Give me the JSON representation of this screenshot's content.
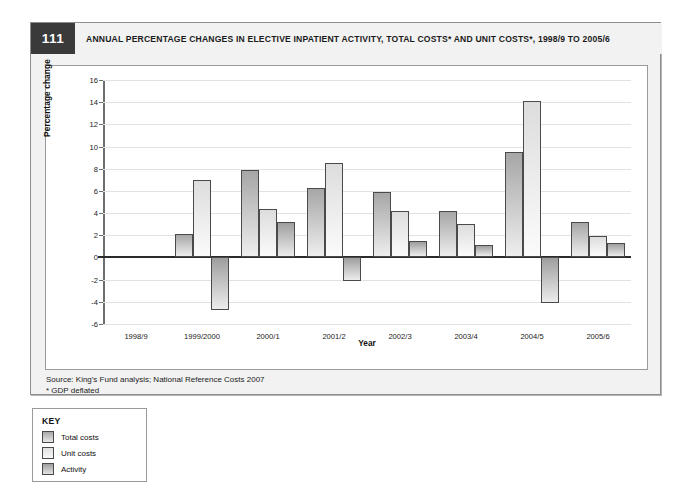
{
  "figure": {
    "number": "111",
    "title": "ANNUAL PERCENTAGE CHANGES IN ELECTIVE INPATIENT ACTIVITY, TOTAL COSTS* AND UNIT COSTS*, 1998/9 TO 2005/6",
    "source": "Source: King's Fund analysis; National Reference Costs 2007",
    "footnote": "* GDP deflated"
  },
  "key": {
    "title": "KEY",
    "items": [
      {
        "label": "Total costs",
        "swatch": "total"
      },
      {
        "label": "Unit costs",
        "swatch": "unit"
      },
      {
        "label": "Activity",
        "swatch": "activity"
      }
    ]
  },
  "chart_data": {
    "type": "bar",
    "title": "ANNUAL PERCENTAGE CHANGES IN ELECTIVE INPATIENT ACTIVITY, TOTAL COSTS* AND UNIT COSTS*, 1998/9 TO 2005/6",
    "xlabel": "Year",
    "ylabel": "Percentage change",
    "ylim": [
      -6,
      16
    ],
    "yticks": [
      16,
      14,
      12,
      10,
      8,
      6,
      4,
      2,
      0,
      -2,
      -4,
      -6
    ],
    "ytick_labels": [
      "16",
      "14",
      "12",
      "10",
      "8",
      "6",
      "4",
      "2",
      "0",
      "-2",
      "-4",
      "-6"
    ],
    "grid": true,
    "legend_position": "below-left",
    "categories": [
      "1998/9",
      "1999/2000",
      "2000/1",
      "2001/2",
      "2002/3",
      "2003/4",
      "2004/5",
      "2005/6"
    ],
    "series": [
      {
        "name": "Total costs",
        "values": [
          null,
          2.1,
          7.9,
          6.3,
          5.9,
          4.2,
          9.5,
          3.2
        ]
      },
      {
        "name": "Unit costs",
        "values": [
          null,
          7.0,
          4.4,
          8.5,
          4.2,
          3.0,
          14.1,
          1.9
        ]
      },
      {
        "name": "Activity",
        "values": [
          null,
          -4.7,
          3.2,
          -2.1,
          1.5,
          1.1,
          -4.1,
          1.3
        ]
      }
    ]
  }
}
